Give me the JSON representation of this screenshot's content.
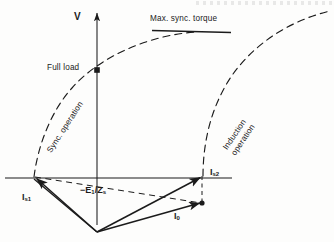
{
  "figure": {
    "kind": "phasor-diagram",
    "ink_color": "#1b1b1b",
    "background_color": "#fdfdfc"
  },
  "axes": {
    "vertical_label": "V",
    "vertical": {
      "x": 97,
      "y_top": 12,
      "y_bottom": 225,
      "arrow": "up"
    },
    "horizontal": {
      "y": 178,
      "x_left": 5,
      "x_right": 232,
      "arrow": "none"
    },
    "origin": {
      "x": 97,
      "y": 178
    }
  },
  "annotations": {
    "max_torque": "Max. sync. torque",
    "full_load": "Full load",
    "sync_operation": "Sync. operation",
    "induction_operation_line1": "Induction",
    "induction_operation_line2": "operation"
  },
  "phasors": {
    "i_s1": {
      "label_main": "I",
      "label_sub": "s1"
    },
    "i_s2": {
      "label_main": "I",
      "label_sub": "s2"
    },
    "i_0": {
      "label_main": "I",
      "label_sub": "0"
    },
    "e_over_z": {
      "sign": "−",
      "numerator_main": "E",
      "numerator_sub": "1",
      "slash": "/",
      "denominator_main": "Z",
      "denominator_sub": "s"
    }
  },
  "markers": {
    "full_load_point": {
      "x": 97,
      "y": 70,
      "shape": "filled-square"
    },
    "i0_tip_point": {
      "x": 202,
      "y": 203,
      "shape": "filled-dot"
    }
  },
  "curves": {
    "sync_locus": "dashed arc rising from left arrowhead on horizontal axis through full-load point to apex",
    "induction_locus": "dashed arc rising from right arrowhead region to upper right corner",
    "tangent_line": "solid horizontal tangent at apex of sync locus"
  }
}
